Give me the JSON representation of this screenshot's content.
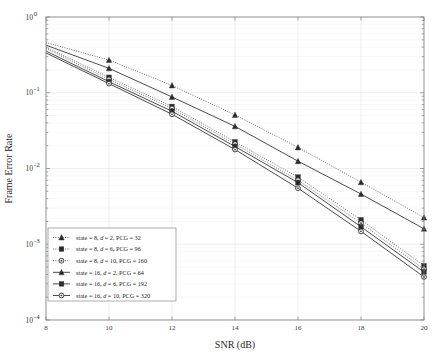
{
  "chart_data": {
    "type": "line",
    "title": "",
    "xlabel": "SNR (dB)",
    "ylabel": "Frame Error Rate",
    "xlim": [
      8,
      20
    ],
    "ylim": [
      0.0001,
      1
    ],
    "yscale": "log",
    "xscale": "linear",
    "grid": true,
    "legend_position": "lower-left",
    "xticks": [
      "8",
      "10",
      "12",
      "14",
      "16",
      "18",
      "20"
    ],
    "xtick_values": [
      8,
      10,
      12,
      14,
      16,
      18,
      20
    ],
    "yticks": [
      "10^0",
      "10^-1",
      "10^-2",
      "10^-3",
      "10^-4"
    ],
    "ytick_values": [
      1,
      0.1,
      0.01,
      0.001,
      0.0001
    ],
    "ytick_mantissa": "10",
    "ytick_exponents": [
      "0",
      "-1",
      "-2",
      "-3",
      "-4"
    ],
    "x": [
      8,
      10,
      12,
      14,
      16,
      18,
      20
    ],
    "series": [
      {
        "name": "state = 8, d = 2, PCG = 32",
        "marker": "triangle",
        "linestyle": "dotted",
        "color": "#2b2b2b",
        "values": [
          0.46,
          0.27,
          0.125,
          0.051,
          0.019,
          0.0066,
          0.00225
        ]
      },
      {
        "name": "state = 8, d = 6, PCG = 96",
        "marker": "square",
        "linestyle": "dotted",
        "color": "#2b2b2b",
        "values": [
          0.4,
          0.16,
          0.066,
          0.0225,
          0.0077,
          0.0021,
          0.00052
        ]
      },
      {
        "name": "state = 8, d = 10, PCG = 160",
        "marker": "circle",
        "linestyle": "dotted",
        "color": "#2b2b2b",
        "values": [
          0.385,
          0.15,
          0.062,
          0.021,
          0.007,
          0.0019,
          0.00047
        ]
      },
      {
        "name": "state = 16, d = 2, PCG = 64",
        "marker": "triangle",
        "linestyle": "solid",
        "color": "#2b2b2b",
        "values": [
          0.425,
          0.21,
          0.088,
          0.036,
          0.0125,
          0.0046,
          0.0016
        ]
      },
      {
        "name": "state = 16, d = 6, PCG = 192",
        "marker": "square",
        "linestyle": "solid",
        "color": "#2b2b2b",
        "values": [
          0.355,
          0.14,
          0.057,
          0.0195,
          0.0065,
          0.0017,
          0.00043
        ]
      },
      {
        "name": "state = 16, d = 10, PCG = 320",
        "marker": "circle",
        "linestyle": "solid",
        "color": "#2b2b2b",
        "values": [
          0.335,
          0.132,
          0.052,
          0.0178,
          0.0055,
          0.00148,
          0.00037
        ]
      }
    ],
    "legend": [
      {
        "prefix": "state = 8, ",
        "italic": "d",
        "suffix": " = 2, PCG = 32",
        "marker": "triangle",
        "linestyle": "dotted"
      },
      {
        "prefix": "state = 8, ",
        "italic": "d",
        "suffix": " = 6, PCG = 96",
        "marker": "square",
        "linestyle": "dotted"
      },
      {
        "prefix": "state = 8, ",
        "italic": "d",
        "suffix": " = 10, PCG = 160",
        "marker": "circle",
        "linestyle": "dotted"
      },
      {
        "prefix": "state = 16, ",
        "italic": "d",
        "suffix": " = 2, PCG = 64",
        "marker": "triangle",
        "linestyle": "solid"
      },
      {
        "prefix": "state = 16, ",
        "italic": "d",
        "suffix": " = 6, PCG = 192",
        "marker": "square",
        "linestyle": "solid"
      },
      {
        "prefix": "state = 16, ",
        "italic": "d",
        "suffix": " = 10, PCG = 320",
        "marker": "circle",
        "linestyle": "solid"
      }
    ]
  },
  "colors": {
    "line": "#2b2b2b",
    "grid": "#e2e2e2",
    "axis": "#808080",
    "background": "#ffffff",
    "legend_border": "#8a8a8a"
  }
}
